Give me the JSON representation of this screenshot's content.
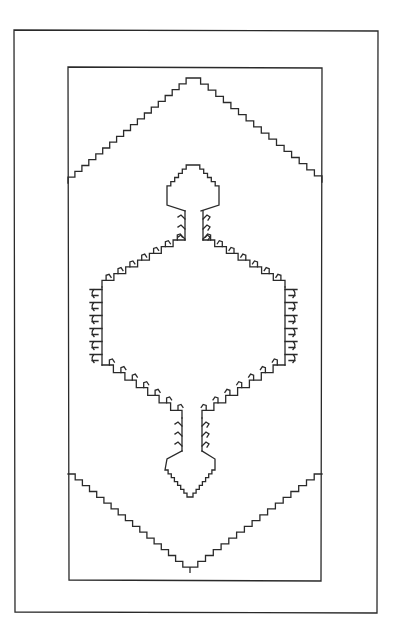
{
  "drawing": {
    "subject": "Rug pattern outline",
    "stroke_color": "#2a2a2a",
    "background_color": "#ffffff",
    "outer_border": {
      "x1": 14,
      "y1": 30,
      "x2": 378,
      "y2": 613
    },
    "inner_border": {
      "x1": 68,
      "y1": 67,
      "x2": 322,
      "y2": 581
    },
    "top_triangle": {
      "left": [
        68,
        183
      ],
      "peak": [
        193,
        78
      ],
      "right": [
        322,
        182
      ],
      "step": 6
    },
    "bottom_triangle": {
      "left": [
        68,
        474
      ],
      "valley": [
        190,
        573
      ],
      "right": [
        322,
        474
      ],
      "step": 6
    },
    "medallion": {
      "center_x": 193,
      "left_x": 102,
      "right_x": 285,
      "side_top_y": 287,
      "side_bottom_y": 365,
      "hook_count_side": 6,
      "top_arrow": {
        "tip": [
          193,
          165
        ],
        "half_width": 26,
        "shoulder_y": 190,
        "base_y": 205,
        "stem_half": 8,
        "stem_bottom": 240
      },
      "bottom_arrow": {
        "tip": [
          190,
          497
        ],
        "half_width": 25,
        "shoulder_y": 470,
        "base_y": 455,
        "stem_half": 8,
        "stem_top": 418
      }
    }
  }
}
